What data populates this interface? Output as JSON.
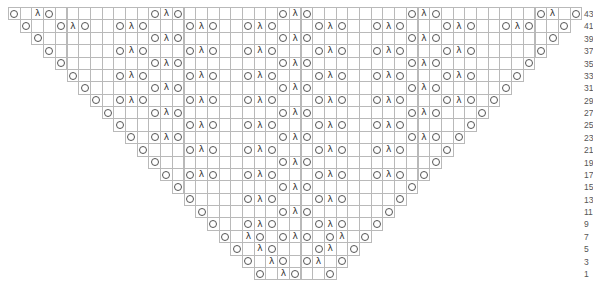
{
  "chart_title": "Lace shawl knitting chart (odd rows 1–43)",
  "legend": {
    "yo": "O (yarn over)",
    "dec": "λ (decrease)",
    "blank": "knit"
  },
  "layout": {
    "origin_x": 8,
    "origin_y": 7,
    "cell_w": 11.7,
    "cell_h": 12.38,
    "columns": 49,
    "label_x": 584
  },
  "colors": {
    "grid": "#b9b9b9",
    "symbol": "#555555",
    "label": "#555555"
  },
  "rows": [
    {
      "label": "43",
      "start": 0,
      "end": 48,
      "yo": [
        0,
        3,
        12,
        14,
        23,
        25,
        34,
        36,
        45,
        48
      ],
      "dec": [
        2,
        13,
        24,
        35,
        46
      ]
    },
    {
      "label": "41",
      "start": 1,
      "end": 47,
      "yo": [
        1,
        4,
        6,
        9,
        11,
        15,
        17,
        20,
        22,
        26,
        28,
        31,
        33,
        37,
        39,
        42,
        44,
        47
      ],
      "dec": [
        5,
        10,
        16,
        21,
        27,
        32,
        38,
        43
      ]
    },
    {
      "label": "39",
      "start": 2,
      "end": 46,
      "yo": [
        2,
        12,
        14,
        23,
        25,
        34,
        36,
        46
      ],
      "dec": [
        13,
        24,
        35
      ]
    },
    {
      "label": "37",
      "start": 3,
      "end": 45,
      "yo": [
        3,
        9,
        11,
        15,
        17,
        20,
        22,
        26,
        28,
        31,
        33,
        37,
        39,
        45
      ],
      "dec": [
        10,
        16,
        21,
        27,
        32,
        38
      ]
    },
    {
      "label": "35",
      "start": 4,
      "end": 44,
      "yo": [
        4,
        12,
        14,
        23,
        25,
        34,
        36,
        44
      ],
      "dec": [
        13,
        24,
        35
      ]
    },
    {
      "label": "33",
      "start": 5,
      "end": 43,
      "yo": [
        5,
        9,
        11,
        15,
        17,
        20,
        22,
        26,
        28,
        31,
        33,
        37,
        39,
        43
      ],
      "dec": [
        10,
        16,
        21,
        27,
        32,
        38
      ]
    },
    {
      "label": "31",
      "start": 6,
      "end": 42,
      "yo": [
        6,
        12,
        14,
        23,
        25,
        34,
        36,
        42
      ],
      "dec": [
        13,
        24,
        35
      ]
    },
    {
      "label": "29",
      "start": 7,
      "end": 41,
      "yo": [
        7,
        9,
        11,
        15,
        17,
        20,
        22,
        26,
        28,
        31,
        33,
        37,
        39,
        41
      ],
      "dec": [
        10,
        16,
        21,
        27,
        32,
        38
      ]
    },
    {
      "label": "27",
      "start": 8,
      "end": 40,
      "yo": [
        8,
        12,
        14,
        23,
        25,
        34,
        36,
        40
      ],
      "dec": [
        13,
        24,
        35
      ]
    },
    {
      "label": "25",
      "start": 9,
      "end": 39,
      "yo": [
        9,
        15,
        17,
        20,
        22,
        26,
        28,
        31,
        33,
        39
      ],
      "dec": [
        16,
        21,
        27,
        32
      ]
    },
    {
      "label": "23",
      "start": 10,
      "end": 38,
      "yo": [
        10,
        12,
        14,
        23,
        25,
        34,
        36,
        38
      ],
      "dec": [
        13,
        24,
        35
      ]
    },
    {
      "label": "21",
      "start": 11,
      "end": 37,
      "yo": [
        11,
        15,
        17,
        20,
        22,
        26,
        28,
        31,
        33,
        37
      ],
      "dec": [
        16,
        21,
        27,
        32
      ]
    },
    {
      "label": "19",
      "start": 12,
      "end": 36,
      "yo": [
        12,
        23,
        25,
        36
      ],
      "dec": [
        24
      ]
    },
    {
      "label": "17",
      "start": 13,
      "end": 35,
      "yo": [
        13,
        15,
        17,
        20,
        22,
        26,
        28,
        31,
        33,
        35
      ],
      "dec": [
        16,
        21,
        27,
        32
      ]
    },
    {
      "label": "15",
      "start": 14,
      "end": 34,
      "yo": [
        14,
        23,
        25,
        34
      ],
      "dec": [
        24
      ]
    },
    {
      "label": "13",
      "start": 15,
      "end": 33,
      "yo": [
        15,
        20,
        22,
        26,
        28,
        33
      ],
      "dec": [
        21,
        27
      ]
    },
    {
      "label": "11",
      "start": 16,
      "end": 32,
      "yo": [
        16,
        23,
        25,
        32
      ],
      "dec": [
        24
      ]
    },
    {
      "label": "9",
      "start": 17,
      "end": 31,
      "yo": [
        17,
        20,
        22,
        26,
        28,
        31
      ],
      "dec": [
        21,
        27
      ]
    },
    {
      "label": "7",
      "start": 18,
      "end": 30,
      "yo": [
        18,
        21,
        23,
        25,
        27,
        30
      ],
      "dec": [
        20,
        24,
        28
      ]
    },
    {
      "label": "5",
      "start": 19,
      "end": 29,
      "yo": [
        19,
        22,
        26,
        29
      ],
      "dec": [
        21,
        27
      ]
    },
    {
      "label": "3",
      "start": 20,
      "end": 28,
      "yo": [
        20,
        23,
        25,
        28
      ],
      "dec": [
        22,
        26
      ]
    },
    {
      "label": "1",
      "start": 21,
      "end": 27,
      "yo": [
        21,
        24,
        27
      ],
      "dec": [
        23
      ]
    }
  ]
}
